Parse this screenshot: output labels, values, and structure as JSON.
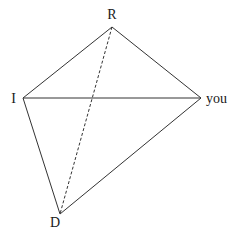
{
  "diagram": {
    "nodes": [
      {
        "id": "R",
        "label": "R",
        "x": 112,
        "y": 27,
        "lx": 112,
        "ly": 19,
        "anchor": "middle"
      },
      {
        "id": "I",
        "label": "I",
        "x": 23,
        "y": 98,
        "lx": 16,
        "ly": 103,
        "anchor": "end"
      },
      {
        "id": "you",
        "label": "you",
        "x": 201,
        "y": 98,
        "lx": 206,
        "ly": 103,
        "anchor": "start"
      },
      {
        "id": "D",
        "label": "D",
        "x": 60,
        "y": 214,
        "lx": 55,
        "ly": 227,
        "anchor": "middle"
      }
    ],
    "edges": [
      {
        "from": "R",
        "to": "I",
        "style": "solid"
      },
      {
        "from": "R",
        "to": "you",
        "style": "solid"
      },
      {
        "from": "I",
        "to": "you",
        "style": "solid"
      },
      {
        "from": "I",
        "to": "D",
        "style": "solid"
      },
      {
        "from": "D",
        "to": "you",
        "style": "solid"
      },
      {
        "from": "R",
        "to": "D",
        "style": "dashed"
      }
    ],
    "colors": {
      "line": "#333333",
      "text": "#1a1a1a",
      "background": "#ffffff"
    }
  }
}
